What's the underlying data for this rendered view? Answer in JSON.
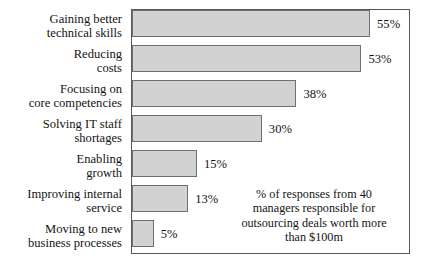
{
  "chart_data": {
    "type": "bar",
    "orientation": "horizontal",
    "title": "",
    "xlabel": "",
    "ylabel": "",
    "xlim": [
      0,
      64
    ],
    "grid": false,
    "legend": null,
    "categories": [
      "Gaining better technical skills",
      "Reducing costs",
      "Focusing on core competencies",
      "Solving IT staff shortages",
      "Enabling growth",
      "Improving internal service",
      "Moving to new business processes"
    ],
    "values": [
      55,
      53,
      38,
      30,
      15,
      13,
      5
    ],
    "value_labels": [
      "55%",
      "53%",
      "38%",
      "30%",
      "15%",
      "13%",
      "5%"
    ],
    "annotation": "% of responses from 40 managers responsible for outsourcing deals worth more than $100m",
    "bar_color": "#d2d2d2",
    "bar_border_color": "#6d7073",
    "frame_color": "#55585c"
  },
  "labels": {
    "rows": [
      {
        "line1": "Gaining better",
        "line2": "technical skills"
      },
      {
        "line1": "Reducing",
        "line2": "costs"
      },
      {
        "line1": "Focusing on",
        "line2": "core competencies"
      },
      {
        "line1": "Solving IT staff",
        "line2": "shortages"
      },
      {
        "line1": "Enabling",
        "line2": "growth"
      },
      {
        "line1": "Improving internal",
        "line2": "service"
      },
      {
        "line1": "Moving to new",
        "line2": "business processes"
      }
    ]
  },
  "annotation": {
    "line1": "% of responses from 40",
    "line2": "managers responsible for",
    "line3": "outsourcing deals worth more",
    "line4": "than $100m"
  }
}
